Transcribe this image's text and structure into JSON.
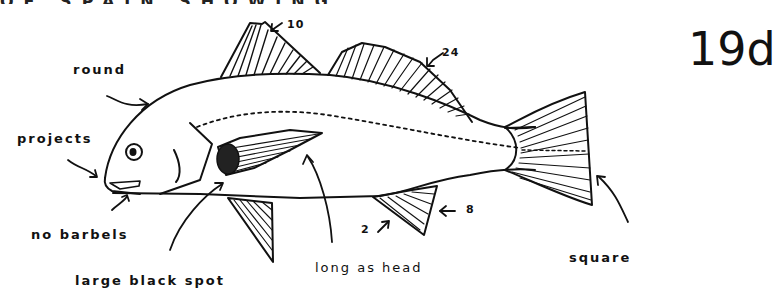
{
  "figure": {
    "plate_id": "19d",
    "cut_off_header": "OF SPAIN SHOWING",
    "labels": {
      "round": "round",
      "projects": "projects",
      "no_barbels": "no barbels",
      "large_black_spot": "large black spot",
      "long_as_head": "long as head",
      "square": "square"
    },
    "fin_ray_counts": {
      "spiny_dorsal": "10",
      "soft_dorsal": "24",
      "anal_spines": "2",
      "anal_soft": "8"
    },
    "colors": {
      "ink": "#111111",
      "paper": "#ffffff"
    }
  }
}
